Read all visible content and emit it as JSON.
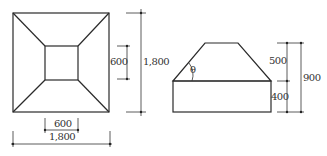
{
  "plan_view": {
    "outer_width_label": "1,800",
    "outer_height_label": "1,800",
    "inner_width_label": "600",
    "inner_height_label": "600"
  },
  "elevation_view": {
    "angle_label": "θ",
    "top_section_height_label": "500",
    "base_height_label": "400",
    "total_height_label": "900"
  },
  "colors": {
    "line": "#2a2a2a",
    "background": "#ffffff"
  }
}
